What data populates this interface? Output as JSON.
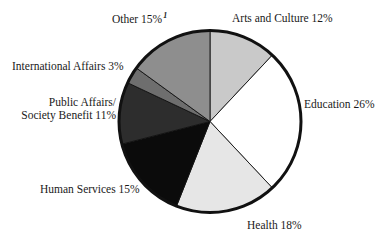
{
  "chart_data": {
    "type": "pie",
    "title": "",
    "subtitle": "",
    "xlabel": "",
    "ylabel": "",
    "grid": false,
    "legend_position": "outside-labels",
    "start_angle_oclock": 12,
    "direction": "clockwise",
    "total_percent": 100,
    "categories": [
      "Arts and Culture",
      "Education",
      "Health",
      "Human Services",
      "Public Affairs/Society Benefit",
      "International Affairs",
      "Other"
    ],
    "values": [
      12,
      26,
      18,
      15,
      11,
      3,
      15
    ],
    "slices": [
      {
        "name": "arts-and-culture",
        "label": "Arts and Culture 12%",
        "category": "Arts and Culture",
        "value": 12,
        "color": "#c9c9c9"
      },
      {
        "name": "education",
        "label": "Education 26%",
        "category": "Education",
        "value": 26,
        "color": "#ffffff"
      },
      {
        "name": "health",
        "label": "Health 18%",
        "category": "Health",
        "value": 18,
        "color": "#e6e6e6"
      },
      {
        "name": "human-services",
        "label": "Human Services 15%",
        "category": "Human Services",
        "value": 15,
        "color": "#0b0b0b"
      },
      {
        "name": "public-affairs-society-benefit",
        "label_line_1": "Public Affairs/",
        "label_line_2": "Society Benefit 11%",
        "category": "Public Affairs/Society Benefit",
        "value": 11,
        "color": "#2d2d2d"
      },
      {
        "name": "international-affairs",
        "label": "International Affairs 3%",
        "category": "International Affairs",
        "value": 3,
        "color": "#6e6e6e"
      },
      {
        "name": "other",
        "label": "Other 15%",
        "footnote_marker": "1",
        "category": "Other",
        "value": 15,
        "color": "#8e8e8e"
      }
    ],
    "outline_color": "#111111",
    "separator_color": "#111111",
    "background": "#ffffff"
  }
}
